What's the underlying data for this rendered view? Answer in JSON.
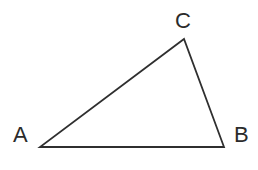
{
  "figure": {
    "kind": "geometry-diagram",
    "shape": "triangle",
    "background_color": "#ffffff",
    "stroke_color": "#2f2f2f",
    "stroke_width": 1.8,
    "label_color": "#2b2b2b",
    "width": 258,
    "height": 170
  },
  "vertices": [
    {
      "id": "A",
      "label": "A",
      "x": 40,
      "y": 147,
      "label_x": 13,
      "label_y": 124
    },
    {
      "id": "B",
      "label": "B",
      "x": 224,
      "y": 147,
      "label_x": 234,
      "label_y": 124
    },
    {
      "id": "C",
      "label": "C",
      "x": 184,
      "y": 39,
      "label_x": 175,
      "label_y": 10
    }
  ],
  "edges": [
    {
      "id": "AB",
      "from": "A",
      "to": "B"
    },
    {
      "id": "BC",
      "from": "B",
      "to": "C"
    },
    {
      "id": "CA",
      "from": "C",
      "to": "A"
    }
  ],
  "polygon_points": "40,147 224,147 184,39"
}
